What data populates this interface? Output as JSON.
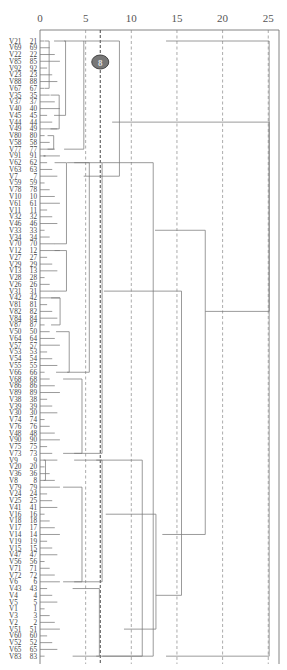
{
  "chart_data": {
    "type": "dendrogram",
    "title": "",
    "xlabel": "",
    "ylabel": "",
    "orientation": "horizontal",
    "x_axis": {
      "position": "top",
      "ticks": [
        0,
        5,
        10,
        15,
        20,
        25
      ],
      "xlim": [
        0,
        26
      ]
    },
    "grid": {
      "style": "dashed",
      "vertical": true
    },
    "cut_line": {
      "value": 6.6,
      "style": "dark-dashed",
      "badge": "8"
    },
    "leaves": [
      {
        "name": "V21",
        "id": "21"
      },
      {
        "name": "V69",
        "id": "69"
      },
      {
        "name": "V22",
        "id": "22"
      },
      {
        "name": "V85",
        "id": "85"
      },
      {
        "name": "V92",
        "id": "92"
      },
      {
        "name": "V23",
        "id": "23"
      },
      {
        "name": "V88",
        "id": "88"
      },
      {
        "name": "V67",
        "id": "67"
      },
      {
        "name": "V35",
        "id": "35"
      },
      {
        "name": "V37",
        "id": "37"
      },
      {
        "name": "V40",
        "id": "40"
      },
      {
        "name": "V45",
        "id": "45"
      },
      {
        "name": "V44",
        "id": "44"
      },
      {
        "name": "V49",
        "id": "49"
      },
      {
        "name": "V80",
        "id": "80"
      },
      {
        "name": "V58",
        "id": "58"
      },
      {
        "name": "V77",
        "id": "77"
      },
      {
        "name": "V91",
        "id": "91"
      },
      {
        "name": "V62",
        "id": "62"
      },
      {
        "name": "V63",
        "id": "63"
      },
      {
        "name": "V7",
        "id": "7"
      },
      {
        "name": "V59",
        "id": "59"
      },
      {
        "name": "V78",
        "id": "78"
      },
      {
        "name": "V10",
        "id": "10"
      },
      {
        "name": "V61",
        "id": "61"
      },
      {
        "name": "V11",
        "id": "11"
      },
      {
        "name": "V32",
        "id": "32"
      },
      {
        "name": "V46",
        "id": "46"
      },
      {
        "name": "V33",
        "id": "33"
      },
      {
        "name": "V34",
        "id": "34"
      },
      {
        "name": "V70",
        "id": "70"
      },
      {
        "name": "V12",
        "id": "12"
      },
      {
        "name": "V27",
        "id": "27"
      },
      {
        "name": "V29",
        "id": "29"
      },
      {
        "name": "V13",
        "id": "13"
      },
      {
        "name": "V28",
        "id": "28"
      },
      {
        "name": "V26",
        "id": "26"
      },
      {
        "name": "V31",
        "id": "31"
      },
      {
        "name": "V42",
        "id": "42"
      },
      {
        "name": "V81",
        "id": "81"
      },
      {
        "name": "V82",
        "id": "82"
      },
      {
        "name": "V84",
        "id": "84"
      },
      {
        "name": "V87",
        "id": "87"
      },
      {
        "name": "V50",
        "id": "50"
      },
      {
        "name": "V64",
        "id": "64"
      },
      {
        "name": "V57",
        "id": "57"
      },
      {
        "name": "V53",
        "id": "53"
      },
      {
        "name": "V54",
        "id": "54"
      },
      {
        "name": "V55",
        "id": "55"
      },
      {
        "name": "V66",
        "id": "66"
      },
      {
        "name": "V68",
        "id": "68"
      },
      {
        "name": "V86",
        "id": "86"
      },
      {
        "name": "V89",
        "id": "89"
      },
      {
        "name": "V38",
        "id": "38"
      },
      {
        "name": "V39",
        "id": "39"
      },
      {
        "name": "V30",
        "id": "30"
      },
      {
        "name": "V74",
        "id": "74"
      },
      {
        "name": "V76",
        "id": "76"
      },
      {
        "name": "V48",
        "id": "48"
      },
      {
        "name": "V90",
        "id": "90"
      },
      {
        "name": "V75",
        "id": "75"
      },
      {
        "name": "V73",
        "id": "73"
      },
      {
        "name": "V9",
        "id": "9"
      },
      {
        "name": "V20",
        "id": "20"
      },
      {
        "name": "V36",
        "id": "36"
      },
      {
        "name": "V8",
        "id": "8"
      },
      {
        "name": "V79",
        "id": "79"
      },
      {
        "name": "V24",
        "id": "24"
      },
      {
        "name": "V25",
        "id": "25"
      },
      {
        "name": "V41",
        "id": "41"
      },
      {
        "name": "V16",
        "id": "16"
      },
      {
        "name": "V18",
        "id": "18"
      },
      {
        "name": "V17",
        "id": "17"
      },
      {
        "name": "V14",
        "id": "14"
      },
      {
        "name": "V19",
        "id": "19"
      },
      {
        "name": "V15",
        "id": "15"
      },
      {
        "name": "V47",
        "id": "47"
      },
      {
        "name": "V56",
        "id": "56"
      },
      {
        "name": "V71",
        "id": "71"
      },
      {
        "name": "V72",
        "id": "72"
      },
      {
        "name": "V6",
        "id": "6"
      },
      {
        "name": "V43",
        "id": "43"
      },
      {
        "name": "V4",
        "id": "4"
      },
      {
        "name": "V5",
        "id": "5"
      },
      {
        "name": "V1",
        "id": "1"
      },
      {
        "name": "V3",
        "id": "3"
      },
      {
        "name": "V2",
        "id": "2"
      },
      {
        "name": "V51",
        "id": "51"
      },
      {
        "name": "V60",
        "id": "60"
      },
      {
        "name": "V52",
        "id": "52"
      },
      {
        "name": "V65",
        "id": "65"
      },
      {
        "name": "V83",
        "id": "83"
      }
    ],
    "merges": [
      {
        "from": 0,
        "to": 7,
        "height": 1.0
      },
      {
        "from": 0,
        "to": 11,
        "height": 2.8
      },
      {
        "from": 8,
        "to": 13,
        "height": 2.1
      },
      {
        "from": 14,
        "to": 16,
        "height": 1.5
      },
      {
        "from": 17,
        "to": 17,
        "height": 0.6
      },
      {
        "from": 0,
        "to": 16,
        "height": 4.8
      },
      {
        "from": 0,
        "to": 20,
        "height": 8.7
      },
      {
        "from": 18,
        "to": 30,
        "height": 2.9
      },
      {
        "from": 31,
        "to": 37,
        "height": 2.9
      },
      {
        "from": 38,
        "to": 42,
        "height": 2.2
      },
      {
        "from": 43,
        "to": 49,
        "height": 3.2
      },
      {
        "from": 18,
        "to": 49,
        "height": 5.4
      },
      {
        "from": 50,
        "to": 61,
        "height": 4.6
      },
      {
        "from": 18,
        "to": 61,
        "height": 6.8
      },
      {
        "from": 62,
        "to": 65,
        "height": 0.6
      },
      {
        "from": 66,
        "to": 80,
        "height": 4.6
      },
      {
        "from": 62,
        "to": 80,
        "height": 6.8
      },
      {
        "from": 81,
        "to": 91,
        "height": 6.5
      },
      {
        "from": 62,
        "to": 91,
        "height": 11.2
      },
      {
        "from": 18,
        "to": 91,
        "height": 12.4
      },
      {
        "from": 0,
        "to": 91,
        "height": 25.1
      }
    ]
  }
}
